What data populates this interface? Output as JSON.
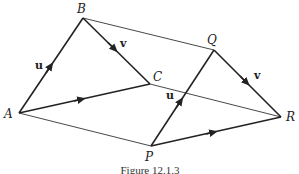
{
  "diagram": {
    "points": {
      "A": {
        "label": "A",
        "x": 19,
        "y": 113
      },
      "B": {
        "label": "B",
        "x": 83,
        "y": 18
      },
      "C": {
        "label": "C",
        "x": 150,
        "y": 84
      },
      "P": {
        "label": "P",
        "x": 151,
        "y": 146
      },
      "Q": {
        "label": "Q",
        "x": 214,
        "y": 50
      },
      "R": {
        "label": "R",
        "x": 281,
        "y": 117
      }
    },
    "vector_labels": {
      "u_left": "u",
      "v_left": "v",
      "u_right": "u",
      "v_right": "v"
    },
    "caption": "Figure 12.1.3"
  }
}
